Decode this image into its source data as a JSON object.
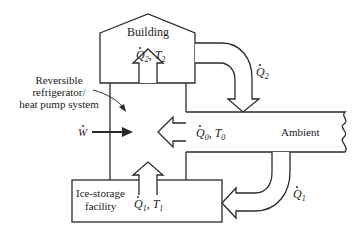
{
  "diagram": {
    "building": {
      "label": "Building",
      "flow_symbol": "Q",
      "flow_sub": "2",
      "temp_symbol": "T",
      "temp_sub": "2"
    },
    "system": {
      "label_lines": [
        "Reversible",
        "refrigerator/",
        "heat pump system"
      ]
    },
    "work": {
      "symbol": "W"
    },
    "ambient": {
      "label": "Ambient",
      "flow_symbol": "Q",
      "flow_sub": "0",
      "temp_symbol": "T",
      "temp_sub": "0"
    },
    "ice_storage": {
      "label_lines": [
        "Ice-storage",
        "facility"
      ],
      "flow_symbol": "Q",
      "flow_sub": "1",
      "temp_symbol": "T",
      "temp_sub": "1"
    },
    "q2_arrow": {
      "symbol": "Q",
      "sub": "2"
    },
    "q1_arrow": {
      "symbol": "Q",
      "sub": "1"
    },
    "colors": {
      "line": "#2a2a2a",
      "background": "#ffffff"
    }
  }
}
